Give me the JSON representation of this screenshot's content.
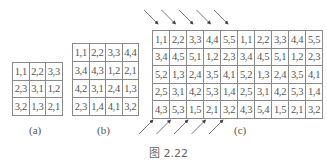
{
  "figure": {
    "caption": "图 2.22",
    "panels": [
      {
        "label": "(a)",
        "rows": [
          [
            "1,1",
            "2,2",
            "3,3"
          ],
          [
            "2,3",
            "3,1",
            "1,2"
          ],
          [
            "3,2",
            "1,3",
            "2,1"
          ]
        ]
      },
      {
        "label": "(b)",
        "rows": [
          [
            "1,1",
            "2,2",
            "3,3",
            "4,4"
          ],
          [
            "3,4",
            "4,3",
            "1,2",
            "2,1"
          ],
          [
            "4,2",
            "3,1",
            "2,4",
            "1,3"
          ],
          [
            "2,3",
            "1,4",
            "4,1",
            "3,2"
          ]
        ]
      },
      {
        "label": "(c)",
        "rows": [
          [
            "1,1",
            "2,2",
            "3,3",
            "4,4",
            "5,5",
            "1,1",
            "2,2",
            "3,3",
            "4,4",
            "5,5"
          ],
          [
            "3,4",
            "4,5",
            "5,1",
            "1,2",
            "2,3",
            "3,4",
            "4,5",
            "5,1",
            "1,2",
            "2,3"
          ],
          [
            "5,2",
            "1,3",
            "2,4",
            "3,5",
            "4,1",
            "5,2",
            "1,3",
            "2,4",
            "3,5",
            "4,1"
          ],
          [
            "2,5",
            "3,1",
            "4,2",
            "5,3",
            "1,4",
            "2,5",
            "3,1",
            "4,2",
            "5,3",
            "1,4"
          ],
          [
            "4,3",
            "5,3",
            "1,5",
            "2,1",
            "3,2",
            "4,3",
            "5,4",
            "1,5",
            "2,1",
            "3,2"
          ]
        ],
        "top_arrows": {
          "count": 5,
          "direction": "down-right"
        },
        "bottom_arrows": {
          "count": 5,
          "direction": "up-right"
        }
      }
    ]
  }
}
